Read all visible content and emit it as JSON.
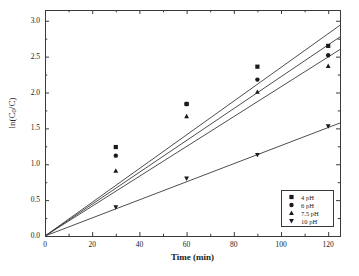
{
  "chart_data": {
    "type": "scatter",
    "title": "",
    "xlabel": "Time (min)",
    "ylabel": "ln(C0/C)",
    "ylabel_parts": {
      "pre": "ln(C",
      "sub": "0",
      "post": "/C)"
    },
    "xlim": [
      0,
      125
    ],
    "ylim": [
      0.0,
      3.15
    ],
    "x_ticks": [
      0,
      20,
      40,
      60,
      80,
      100,
      120
    ],
    "x_tick_labels": [
      "0",
      "20",
      "40",
      "60",
      "80",
      "100",
      "120"
    ],
    "x_minor_ticks": [
      10,
      30,
      50,
      70,
      90,
      110
    ],
    "y_ticks": [
      0.0,
      0.5,
      1.0,
      1.5,
      2.0,
      2.5,
      3.0
    ],
    "y_tick_labels": [
      "0.0",
      "0.5",
      "1.0",
      "1.5",
      "2.0",
      "2.5",
      "3.0"
    ],
    "y_minor_ticks": [
      0.25,
      0.75,
      1.25,
      1.75,
      2.25,
      2.75
    ],
    "grid": false,
    "legend_position": "lower-right",
    "marker_color": "#1a1a1a",
    "line_color": "#3a3a3a",
    "axis_color": "#3a3a3a",
    "x": [
      0,
      30,
      60,
      90,
      120
    ],
    "series": [
      {
        "name": "4 pH",
        "marker": "square",
        "x": [
          30,
          60,
          90,
          120
        ],
        "values": [
          1.24,
          1.84,
          2.36,
          2.65
        ],
        "fit_slope": 0.0235,
        "fit_intercept": 0.0
      },
      {
        "name": "6 pH",
        "marker": "circle",
        "x": [
          30,
          60,
          90,
          120
        ],
        "values": [
          1.12,
          1.84,
          2.18,
          2.52
        ],
        "fit_slope": 0.0222,
        "fit_intercept": 0.0
      },
      {
        "name": "7.5 pH",
        "marker": "triangle-up",
        "x": [
          30,
          60,
          90,
          120
        ],
        "values": [
          0.91,
          1.67,
          2.01,
          2.37
        ],
        "fit_slope": 0.0208,
        "fit_intercept": 0.0
      },
      {
        "name": "10 pH",
        "marker": "triangle-down",
        "x": [
          30,
          60,
          90,
          120
        ],
        "values": [
          0.4,
          0.8,
          1.13,
          1.53
        ],
        "fit_slope": 0.0126,
        "fit_intercept": 0.0
      }
    ]
  },
  "legend": {
    "entries": [
      {
        "label": "4 pH",
        "marker": "square"
      },
      {
        "label": "6 pH",
        "marker": "circle"
      },
      {
        "label": "7.5 pH",
        "marker": "triangle-up"
      },
      {
        "label": "10 pH",
        "marker": "triangle-down"
      }
    ]
  },
  "axes": {
    "x_title": "Time (min)",
    "y_title_pre": "ln(C",
    "y_title_sub": "0",
    "y_title_post": "/C)"
  },
  "caption": {
    "text": ""
  }
}
